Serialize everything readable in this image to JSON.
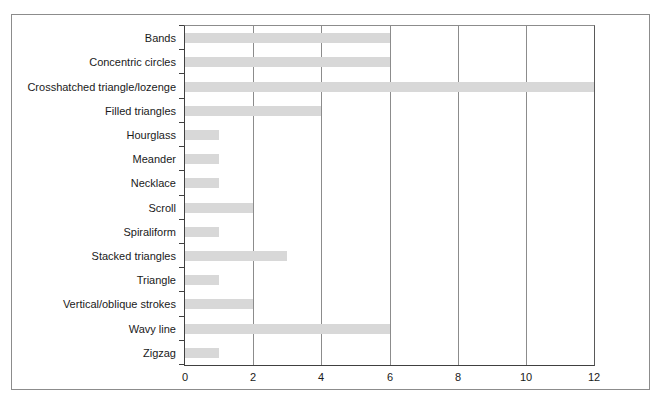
{
  "chart_data": {
    "type": "bar",
    "orientation": "horizontal",
    "title": "",
    "xlabel": "",
    "ylabel": "",
    "categories": [
      "Bands",
      "Concentric circles",
      "Crosshatched triangle/lozenge",
      "Filled triangles",
      "Hourglass",
      "Meander",
      "Necklace",
      "Scroll",
      "Spiraliform",
      "Stacked triangles",
      "Triangle",
      "Vertical/oblique strokes",
      "Wavy line",
      "Zigzag"
    ],
    "values": [
      6,
      6,
      12,
      4,
      1,
      1,
      1,
      2,
      1,
      3,
      1,
      2,
      6,
      1
    ],
    "xlim": [
      0,
      12
    ],
    "x_ticks": [
      0,
      2,
      4,
      6,
      8,
      10,
      12
    ],
    "grid": true,
    "legend": false,
    "colors": {
      "bar_fill": "#d8d8d8",
      "gridline": "#8c8c8c",
      "axis": "#404040",
      "frame_border": "#8c8c8c",
      "text": "#1a1a1a",
      "background": "#ffffff"
    }
  }
}
